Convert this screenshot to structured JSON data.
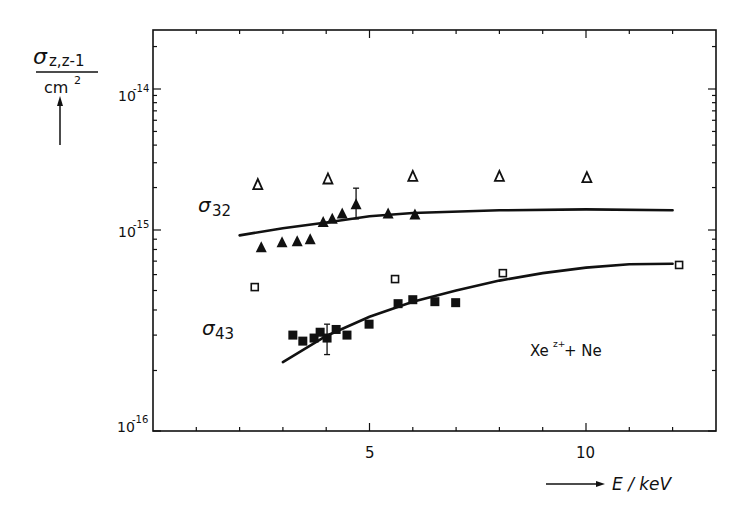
{
  "chart_data": {
    "type": "scatter",
    "title": "",
    "annotation": "Xe^{z+} + Ne",
    "annotation_parts": {
      "base": "Xe",
      "sup": "z+",
      "rest": " + Ne"
    },
    "xlabel": "E / keV",
    "ylabel_numerator": "σz,z-1",
    "ylabel_sigma": "σ",
    "ylabel_sub": "z,z-1",
    "ylabel_denominator": "cm",
    "ylabel_denominator_sup": "2",
    "x_axis": {
      "range": [
        0,
        13
      ],
      "major_ticks": [
        5,
        10
      ],
      "tick_labels": [
        "5",
        "10"
      ],
      "minor_step": 1
    },
    "y_axis": {
      "scale": "log",
      "range": [
        1e-16,
        2.5e-14
      ],
      "tick_labels": [
        {
          "base": "10",
          "exp": "-14",
          "value": 1e-14
        },
        {
          "base": "10",
          "exp": "-15",
          "value": 1e-15
        },
        {
          "base": "10",
          "exp": "-16",
          "value": 1e-16
        }
      ]
    },
    "grid": false,
    "legend": null,
    "series": [
      {
        "name": "σ32 (filled triangles)",
        "label_sigma": "σ",
        "label_sub": "32",
        "marker": "filled-triangle",
        "x": [
          2.5,
          2.98,
          3.33,
          3.63,
          3.93,
          4.14,
          4.37,
          4.69,
          5.43,
          6.05
        ],
        "y": [
          8.2e-16,
          8.7e-16,
          8.8e-16,
          9e-16,
          1.14e-15,
          1.2e-15,
          1.31e-15,
          1.52e-15,
          1.31e-15,
          1.29e-15
        ],
        "error_bar": {
          "x": 4.69,
          "low": 1.2e-15,
          "high": 1.98e-15
        }
      },
      {
        "name": "σ32 other data (open triangles)",
        "marker": "open-triangle",
        "x": [
          2.42,
          4.04,
          6.0,
          8.0,
          10.02
        ],
        "y": [
          2.1e-15,
          2.3e-15,
          2.4e-15,
          2.4e-15,
          2.35e-15
        ]
      },
      {
        "name": "σ43 (filled squares)",
        "label_sigma": "σ",
        "label_sub": "43",
        "marker": "filled-square",
        "x": [
          3.23,
          3.46,
          3.72,
          3.86,
          4.02,
          4.23,
          4.48,
          4.99,
          5.66,
          6.0,
          6.51,
          6.99
        ],
        "y": [
          3e-16,
          2.8e-16,
          2.9e-16,
          3.1e-16,
          2.9e-16,
          3.2e-16,
          3e-16,
          3.4e-16,
          4.3e-16,
          4.5e-16,
          4.4e-16,
          4.35e-16
        ],
        "error_bar": {
          "x": 4.02,
          "low": 2.4e-16,
          "high": 3.4e-16
        }
      },
      {
        "name": "σ43 other data (open squares)",
        "marker": "open-square",
        "x": [
          2.35,
          5.59,
          8.08,
          12.15
        ],
        "y": [
          5.2e-16,
          5.7e-16,
          6.1e-16,
          6.7e-16
        ]
      },
      {
        "name": "σ32 theory curve",
        "marker": "line",
        "x": [
          2.0,
          3.0,
          4.0,
          5.0,
          6.0,
          8.0,
          10.0,
          12.0
        ],
        "y": [
          9.4e-16,
          1.03e-15,
          1.13e-15,
          1.25e-15,
          1.32e-15,
          1.38e-15,
          1.4e-15,
          1.38e-15
        ]
      },
      {
        "name": "σ43 theory curve",
        "marker": "line",
        "x": [
          3.0,
          4.0,
          5.0,
          6.0,
          7.0,
          8.0,
          9.0,
          10.0,
          11.0,
          12.0
        ],
        "y": [
          2.2e-16,
          2.97e-16,
          3.7e-16,
          4.4e-16,
          5e-16,
          5.6e-16,
          6.1e-16,
          6.5e-16,
          6.75e-16,
          6.8e-16
        ]
      }
    ]
  }
}
